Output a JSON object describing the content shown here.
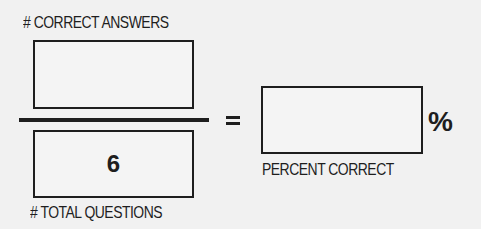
{
  "numerator": {
    "label": "# CORRECT ANSWERS",
    "value": ""
  },
  "denominator": {
    "label": "# TOTAL QUESTIONS",
    "value": "6"
  },
  "equals_sign": "=",
  "result": {
    "label": "PERCENT CORRECT",
    "value": "",
    "unit": "%"
  }
}
